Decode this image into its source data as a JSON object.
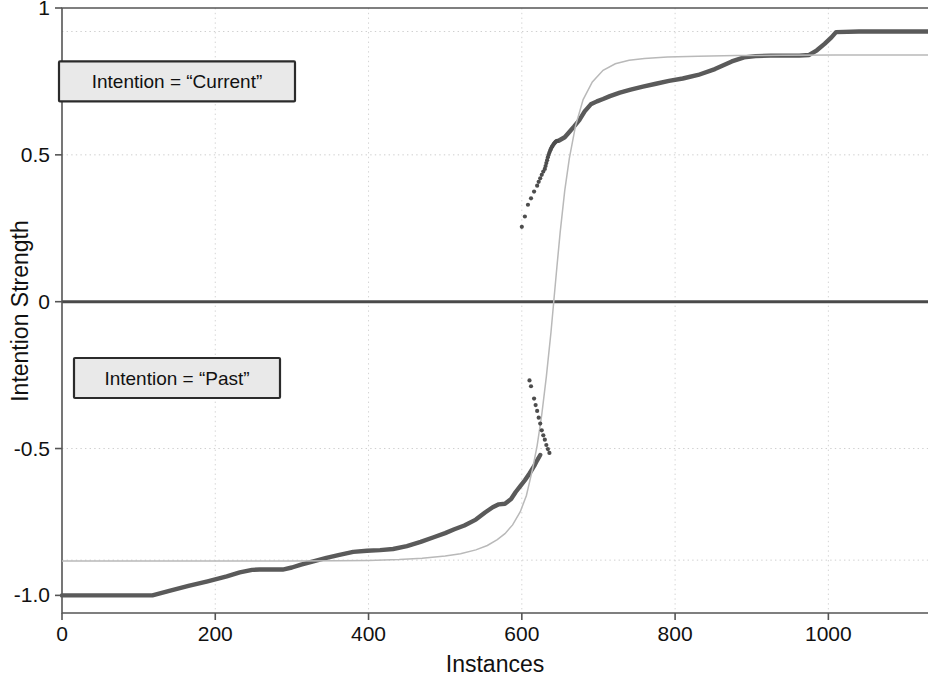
{
  "chart_data": {
    "type": "line",
    "title": "",
    "xlabel": "Instances",
    "ylabel": "Intention Strength",
    "xlim": [
      0,
      1130
    ],
    "ylim": [
      -1.06,
      1.0
    ],
    "grid": true,
    "legend_position": "none",
    "xticks": [
      0,
      200,
      400,
      600,
      800,
      1000
    ],
    "xtick_labels": [
      "0",
      "200",
      "400",
      "600",
      "800",
      "1000"
    ],
    "yticks": [
      1,
      0.5,
      0,
      -0.5,
      -1.0
    ],
    "ytick_labels": [
      "1",
      "0.5",
      "0",
      "-0.5",
      "-1.0"
    ],
    "gridlines_y": [
      0.92,
      0.5,
      -0.5,
      -0.88
    ],
    "zero_line_y": 0,
    "annotations": [
      {
        "id": "annot-current",
        "text": "Intention = “Current”",
        "x": 150,
        "y": 0.75
      },
      {
        "id": "annot-past",
        "text": "Intention = “Past”",
        "x": 150,
        "y": -0.26
      }
    ],
    "series": [
      {
        "name": "observed-intention-strength",
        "style": "thick-dark-stepped",
        "color": "#5a5a5a",
        "x": [
          0,
          40,
          80,
          118,
          140,
          165,
          190,
          215,
          232,
          248,
          258,
          272,
          288,
          300,
          312,
          328,
          345,
          362,
          380,
          398,
          415,
          432,
          450,
          468,
          485,
          500,
          512,
          525,
          540,
          552,
          562,
          570,
          578,
          586,
          592,
          598,
          604,
          610,
          616,
          620,
          624
        ],
        "y": [
          -1.0,
          -1.0,
          -1.0,
          -1.0,
          -0.985,
          -0.968,
          -0.952,
          -0.935,
          -0.922,
          -0.913,
          -0.912,
          -0.912,
          -0.912,
          -0.905,
          -0.895,
          -0.884,
          -0.872,
          -0.862,
          -0.852,
          -0.848,
          -0.846,
          -0.842,
          -0.832,
          -0.818,
          -0.802,
          -0.788,
          -0.775,
          -0.762,
          -0.742,
          -0.718,
          -0.7,
          -0.69,
          -0.688,
          -0.672,
          -0.648,
          -0.628,
          -0.608,
          -0.585,
          -0.56,
          -0.54,
          -0.522
        ]
      },
      {
        "name": "observed-intention-strength-upper",
        "style": "thick-dark-stepped",
        "color": "#5a5a5a",
        "x": [
          648,
          656,
          662,
          668,
          675,
          682,
          690,
          698,
          706,
          715,
          728,
          742,
          758,
          775,
          792,
          810,
          830,
          852,
          874,
          890,
          905,
          925,
          945,
          962,
          975,
          985,
          995,
          1004,
          1010,
          1040,
          1080,
          1130
        ],
        "y": [
          0.548,
          0.56,
          0.578,
          0.596,
          0.618,
          0.648,
          0.672,
          0.682,
          0.69,
          0.7,
          0.712,
          0.722,
          0.732,
          0.742,
          0.752,
          0.76,
          0.772,
          0.792,
          0.818,
          0.832,
          0.836,
          0.838,
          0.838,
          0.838,
          0.84,
          0.856,
          0.878,
          0.9,
          0.918,
          0.92,
          0.92,
          0.92
        ]
      },
      {
        "name": "fitted-sigmoid-model",
        "style": "thin-light-smooth",
        "color": "#b9b9b9",
        "x": [
          0,
          60,
          120,
          180,
          240,
          300,
          360,
          400,
          440,
          470,
          500,
          520,
          540,
          555,
          568,
          578,
          588,
          598,
          606,
          614,
          620,
          626,
          632,
          638,
          642,
          646,
          650,
          656,
          662,
          670,
          680,
          692,
          706,
          722,
          740,
          760,
          790,
          830,
          880,
          940,
          1010,
          1080,
          1130
        ],
        "y": [
          -0.883,
          -0.883,
          -0.883,
          -0.883,
          -0.883,
          -0.883,
          -0.882,
          -0.881,
          -0.878,
          -0.874,
          -0.866,
          -0.858,
          -0.845,
          -0.83,
          -0.81,
          -0.79,
          -0.76,
          -0.715,
          -0.66,
          -0.57,
          -0.49,
          -0.385,
          -0.255,
          -0.105,
          0.01,
          0.125,
          0.235,
          0.378,
          0.488,
          0.598,
          0.688,
          0.748,
          0.788,
          0.81,
          0.822,
          0.828,
          0.833,
          0.836,
          0.838,
          0.839,
          0.84,
          0.84,
          0.84
        ]
      },
      {
        "name": "sparse-transition-points-upper",
        "style": "scatter-dots",
        "color": "#4d4d4d",
        "x": [
          600,
          604,
          608,
          612,
          616,
          620,
          622,
          624,
          626,
          628,
          630,
          631,
          632,
          633,
          634,
          635,
          636,
          637,
          638,
          639,
          640,
          641,
          642,
          643,
          644,
          645,
          646
        ],
        "y": [
          0.255,
          0.29,
          0.33,
          0.352,
          0.375,
          0.395,
          0.408,
          0.42,
          0.432,
          0.443,
          0.452,
          0.462,
          0.472,
          0.482,
          0.492,
          0.5,
          0.508,
          0.515,
          0.52,
          0.526,
          0.53,
          0.534,
          0.538,
          0.541,
          0.544,
          0.546,
          0.548
        ]
      },
      {
        "name": "sparse-transition-points-lower",
        "style": "scatter-dots",
        "color": "#4d4d4d",
        "x": [
          610,
          612,
          616,
          618,
          620,
          622,
          624,
          626,
          628,
          630,
          632,
          634,
          636
        ],
        "y": [
          -0.268,
          -0.288,
          -0.33,
          -0.352,
          -0.372,
          -0.395,
          -0.415,
          -0.438,
          -0.455,
          -0.47,
          -0.488,
          -0.502,
          -0.515
        ]
      }
    ]
  },
  "axis_meta": {
    "y_label_text": "Intention Strength",
    "x_label_text": "Instances"
  }
}
